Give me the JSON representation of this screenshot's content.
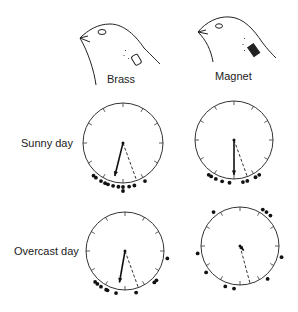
{
  "columns": [
    {
      "label": "Brass",
      "bird": "brass-bird-drawing"
    },
    {
      "label": "Magnet",
      "bird": "magnet-bird-drawing"
    }
  ],
  "rows": [
    {
      "label": "Sunny day"
    },
    {
      "label": "Overcast day"
    }
  ],
  "plots": [
    {
      "id": "brass-sunny",
      "center": [
        123,
        143
      ],
      "radius": 40,
      "mean_vector_deg": 194,
      "mean_vector_length": 0.85,
      "expected_direction_deg": 160,
      "points_deg": [
        222,
        218,
        210,
        204,
        200,
        193,
        186,
        180,
        180,
        172,
        165,
        150
      ]
    },
    {
      "id": "magnet-sunny",
      "center": [
        234,
        140
      ],
      "radius": 39,
      "mean_vector_deg": 180,
      "mean_vector_length": 0.9,
      "expected_direction_deg": 160,
      "points_deg": [
        216,
        212,
        205,
        196,
        186,
        168,
        162,
        150,
        144
      ]
    },
    {
      "id": "brass-overcast",
      "center": [
        125,
        251
      ],
      "radius": 39,
      "mean_vector_deg": 190,
      "mean_vector_length": 0.82,
      "expected_direction_deg": 160,
      "points_deg": [
        224,
        220,
        214,
        206,
        204,
        192,
        165,
        137,
        133,
        100
      ]
    },
    {
      "id": "magnet-overcast",
      "center": [
        240,
        246
      ],
      "radius": 39,
      "mean_vector_deg": 140,
      "mean_vector_length": 0.15,
      "expected_direction_deg": 165,
      "points_deg": [
        322,
        32,
        38,
        45,
        105,
        140,
        188,
        200,
        232,
        260
      ]
    }
  ]
}
